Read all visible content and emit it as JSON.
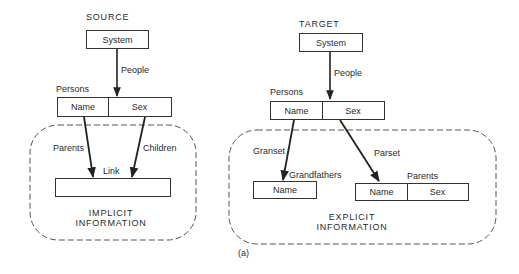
{
  "caption": "(a)",
  "source": {
    "heading": "SOURCE",
    "system_box": "System",
    "people_edge": "People",
    "persons_label": "Persons",
    "persons_fields": [
      "Name",
      "Sex"
    ],
    "region_label_line1": "IMPLICIT",
    "region_label_line2": "INFORMATION",
    "parents_edge": "Parents",
    "children_edge": "Children",
    "link_label": "Link",
    "link_box": ""
  },
  "target": {
    "heading": "TARGET",
    "system_box": "System",
    "people_edge": "People",
    "persons_label": "Persons",
    "persons_fields": [
      "Name",
      "Sex"
    ],
    "region_label_line1": "EXPLICIT",
    "region_label_line2": "INFORMATION",
    "granset_edge": "Granset",
    "grandfathers_label": "Grandfathers",
    "grandfathers_fields": [
      "Name"
    ],
    "parset_edge": "Parset",
    "parents_label": "Parents",
    "parents_fields": [
      "Name",
      "Sex"
    ]
  },
  "colors": {
    "line": "#222222",
    "dashed": "#555555",
    "background": "#ffffff"
  }
}
